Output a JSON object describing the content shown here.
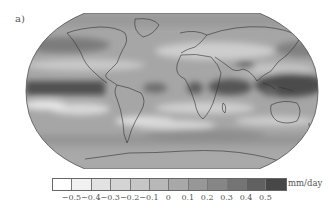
{
  "figure": {
    "panel_label": "a)"
  },
  "chart_data": {
    "type": "heatmap",
    "title": "",
    "subtitle": "",
    "projection": "Robinson (global map)",
    "colormap": "grayscale, light (negative) to dark (positive)",
    "colorbar": {
      "unit": "mm/day",
      "tick_labels": [
        "−0.5",
        "−0.4",
        "−0.3",
        "−0.2",
        "−0.1",
        "0",
        "0.1",
        "0.2",
        "0.3",
        "0.4",
        "0.5"
      ],
      "tick_values": [
        -0.5,
        -0.4,
        -0.3,
        -0.2,
        -0.1,
        0,
        0.1,
        0.2,
        0.3,
        0.4,
        0.5
      ],
      "n_bins": 12,
      "bin_colors": [
        "#ffffff",
        "#f1f1f1",
        "#e2e2e2",
        "#d4d4d4",
        "#c6c6c6",
        "#b8b8b8",
        "#a8a8a8",
        "#979797",
        "#868686",
        "#747474",
        "#606060",
        "#474747"
      ],
      "range": [
        -0.6,
        0.6
      ]
    },
    "regions_described": [
      {
        "region": "Equatorial Pacific (ITCZ band)",
        "approx_value": 0.5
      },
      {
        "region": "Western Pacific / Maritime Continent",
        "approx_value": 0.5
      },
      {
        "region": "Indian Ocean equatorial band",
        "approx_value": 0.4
      },
      {
        "region": "Equatorial Atlantic / West Africa",
        "approx_value": 0.3
      },
      {
        "region": "Subtropical Southeast Pacific",
        "approx_value": -0.4
      },
      {
        "region": "Subtropical South Atlantic / Indian Ocean",
        "approx_value": -0.3
      },
      {
        "region": "Mediterranean / Sahara",
        "approx_value": -0.2
      },
      {
        "region": "North Pacific storm track",
        "approx_value": 0.3
      },
      {
        "region": "Southern Ocean",
        "approx_value": 0.2
      },
      {
        "region": "Antarctica",
        "approx_value": 0.0
      }
    ],
    "legend_position": "bottom"
  }
}
